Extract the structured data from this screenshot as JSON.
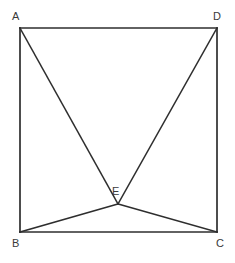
{
  "figure": {
    "shape_type": "square-with-interior-point",
    "background_color": "#ffffff",
    "stroke_color": "#2e2e2e",
    "label_color": "#3a3a3a",
    "canvas": {
      "width": 235,
      "height": 263
    },
    "points": {
      "A": {
        "name": "A",
        "x": 20,
        "y": 28
      },
      "D": {
        "name": "D",
        "x": 217,
        "y": 28
      },
      "B": {
        "name": "B",
        "x": 20,
        "y": 232
      },
      "C": {
        "name": "C",
        "x": 217,
        "y": 232
      },
      "E": {
        "name": "E",
        "x": 118,
        "y": 204
      }
    },
    "labels": [
      {
        "text": "A",
        "left": 12,
        "top": 11
      },
      {
        "text": "D",
        "left": 213,
        "top": 11
      },
      {
        "text": "B",
        "left": 12,
        "top": 238
      },
      {
        "text": "C",
        "left": 216,
        "top": 238
      },
      {
        "text": "E",
        "left": 112,
        "top": 186
      }
    ],
    "segments": [
      {
        "id": "AD",
        "from": "A",
        "to": "D",
        "kind": "edge"
      },
      {
        "id": "DC",
        "from": "D",
        "to": "C",
        "kind": "edge"
      },
      {
        "id": "CB",
        "from": "C",
        "to": "B",
        "kind": "edge"
      },
      {
        "id": "BA",
        "from": "B",
        "to": "A",
        "kind": "edge"
      },
      {
        "id": "AE",
        "from": "A",
        "to": "E",
        "kind": "cevian"
      },
      {
        "id": "DE",
        "from": "D",
        "to": "E",
        "kind": "cevian"
      },
      {
        "id": "BE",
        "from": "B",
        "to": "E",
        "kind": "cevian"
      },
      {
        "id": "CE",
        "from": "C",
        "to": "E",
        "kind": "cevian"
      }
    ]
  }
}
